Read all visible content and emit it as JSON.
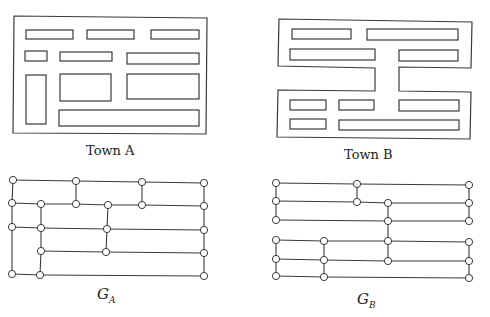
{
  "colors": {
    "stroke": "#3a3a3a",
    "node_fill": "#ffffff",
    "background": "#ffffff"
  },
  "labels": {
    "town_a": "Town A",
    "town_b": "Town B",
    "graph_a_main": "G",
    "graph_a_sub": "A",
    "graph_b_main": "G",
    "graph_b_sub": "B"
  },
  "town_a": {
    "outline": [
      [
        14,
        16
      ],
      [
        207,
        18
      ],
      [
        206,
        134
      ],
      [
        13,
        133
      ]
    ],
    "blocks": [
      [
        26,
        30,
        47,
        9
      ],
      [
        87,
        30,
        47,
        9
      ],
      [
        151,
        30,
        48,
        9
      ],
      [
        25,
        51,
        22,
        10
      ],
      [
        60,
        52,
        52,
        9
      ],
      [
        127,
        53,
        72,
        11
      ],
      [
        26,
        75,
        20,
        49
      ],
      [
        60,
        74,
        51,
        27
      ],
      [
        127,
        74,
        72,
        25
      ],
      [
        59,
        110,
        140,
        16
      ]
    ]
  },
  "town_b": {
    "outline": [
      [
        279,
        19
      ],
      [
        472,
        22
      ],
      [
        471,
        68
      ],
      [
        399,
        67
      ],
      [
        399,
        91
      ],
      [
        471,
        92
      ],
      [
        470,
        139
      ],
      [
        277,
        137
      ],
      [
        278,
        90
      ],
      [
        375,
        91
      ],
      [
        375,
        68
      ],
      [
        278,
        66
      ]
    ],
    "blocks": [
      [
        292,
        29,
        59,
        10
      ],
      [
        367,
        29,
        91,
        11
      ],
      [
        290,
        49,
        85,
        11
      ],
      [
        399,
        50,
        59,
        11
      ],
      [
        290,
        100,
        36,
        10
      ],
      [
        339,
        100,
        35,
        10
      ],
      [
        399,
        100,
        60,
        11
      ],
      [
        290,
        119,
        36,
        10
      ],
      [
        339,
        120,
        120,
        10
      ]
    ]
  },
  "graph_a": {
    "nodes": [
      [
        13,
        180
      ],
      [
        76,
        181
      ],
      [
        142,
        182
      ],
      [
        204,
        183
      ],
      [
        12,
        203
      ],
      [
        41,
        204
      ],
      [
        76,
        204
      ],
      [
        108,
        205
      ],
      [
        142,
        205
      ],
      [
        204,
        206
      ],
      [
        12,
        227
      ],
      [
        41,
        228
      ],
      [
        107,
        229
      ],
      [
        204,
        230
      ],
      [
        41,
        251
      ],
      [
        106,
        252
      ],
      [
        204,
        253
      ],
      [
        12,
        274
      ],
      [
        40,
        275
      ],
      [
        204,
        276
      ]
    ],
    "edges": [
      [
        0,
        1
      ],
      [
        1,
        2
      ],
      [
        2,
        3
      ],
      [
        4,
        5
      ],
      [
        5,
        6
      ],
      [
        6,
        7
      ],
      [
        7,
        8
      ],
      [
        8,
        9
      ],
      [
        10,
        11
      ],
      [
        11,
        12
      ],
      [
        12,
        13
      ],
      [
        14,
        15
      ],
      [
        15,
        16
      ],
      [
        17,
        18
      ],
      [
        18,
        19
      ],
      [
        0,
        4
      ],
      [
        4,
        10
      ],
      [
        10,
        17
      ],
      [
        5,
        11
      ],
      [
        11,
        14
      ],
      [
        14,
        18
      ],
      [
        1,
        6
      ],
      [
        2,
        8
      ],
      [
        7,
        12
      ],
      [
        12,
        15
      ],
      [
        3,
        9
      ],
      [
        9,
        13
      ],
      [
        13,
        16
      ],
      [
        16,
        19
      ]
    ]
  },
  "graph_b": {
    "nodes": [
      [
        276,
        183
      ],
      [
        357,
        184
      ],
      [
        469,
        185
      ],
      [
        276,
        201
      ],
      [
        357,
        202
      ],
      [
        388,
        203
      ],
      [
        469,
        203
      ],
      [
        276,
        220
      ],
      [
        388,
        221
      ],
      [
        469,
        221
      ],
      [
        276,
        240
      ],
      [
        324,
        241
      ],
      [
        388,
        241
      ],
      [
        469,
        242
      ],
      [
        276,
        259
      ],
      [
        324,
        260
      ],
      [
        388,
        261
      ],
      [
        469,
        261
      ],
      [
        276,
        276
      ],
      [
        324,
        277
      ],
      [
        469,
        278
      ]
    ],
    "edges": [
      [
        0,
        1
      ],
      [
        1,
        2
      ],
      [
        3,
        4
      ],
      [
        4,
        5
      ],
      [
        5,
        6
      ],
      [
        7,
        8
      ],
      [
        8,
        9
      ],
      [
        10,
        11
      ],
      [
        11,
        12
      ],
      [
        12,
        13
      ],
      [
        14,
        15
      ],
      [
        15,
        16
      ],
      [
        16,
        17
      ],
      [
        18,
        19
      ],
      [
        19,
        20
      ],
      [
        0,
        3
      ],
      [
        3,
        7
      ],
      [
        1,
        4
      ],
      [
        2,
        6
      ],
      [
        6,
        9
      ],
      [
        5,
        8
      ],
      [
        8,
        12
      ],
      [
        12,
        16
      ],
      [
        10,
        14
      ],
      [
        14,
        18
      ],
      [
        11,
        15
      ],
      [
        15,
        19
      ],
      [
        13,
        17
      ],
      [
        17,
        20
      ]
    ]
  }
}
